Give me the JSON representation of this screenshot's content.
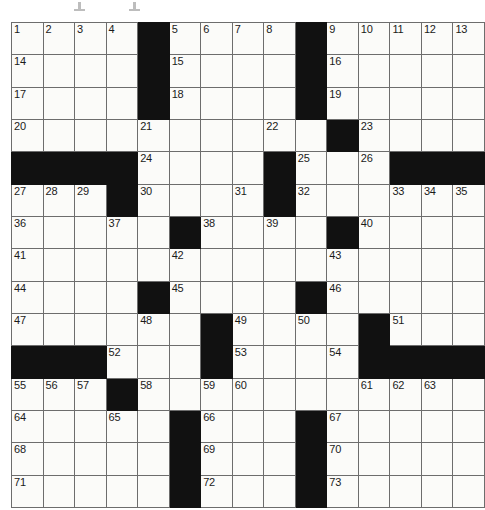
{
  "puzzle": {
    "title": "Crossword Puzzle Grid",
    "rows": 15,
    "cols": 15,
    "cell_size": 31,
    "colors": {
      "block": "#111111",
      "cell": "#fbfbf9",
      "grid_line": "#6d6d6d",
      "number_text": "#1a1a1a",
      "page_background": "#ffffff"
    },
    "numbers_total": 73,
    "across_numbers": [
      1,
      5,
      9,
      14,
      15,
      16,
      17,
      18,
      19,
      20,
      22,
      23,
      24,
      25,
      27,
      30,
      32,
      33,
      36,
      37,
      38,
      40,
      41,
      42,
      43,
      44,
      45,
      46,
      47,
      49,
      51,
      52,
      53,
      55,
      58,
      59,
      61,
      64,
      65,
      66,
      67,
      68,
      69,
      70,
      71,
      72,
      73
    ],
    "down_numbers": [
      1,
      2,
      3,
      4,
      5,
      6,
      7,
      8,
      9,
      10,
      11,
      12,
      13,
      21,
      26,
      28,
      29,
      31,
      34,
      35,
      39,
      48,
      50,
      54,
      56,
      57,
      60,
      62,
      63
    ],
    "grid": [
      [
        {
          "block": false,
          "number": "1"
        },
        {
          "block": false,
          "number": "2"
        },
        {
          "block": false,
          "number": "3"
        },
        {
          "block": false,
          "number": "4"
        },
        {
          "block": true,
          "number": ""
        },
        {
          "block": false,
          "number": "5"
        },
        {
          "block": false,
          "number": "6"
        },
        {
          "block": false,
          "number": "7"
        },
        {
          "block": false,
          "number": "8"
        },
        {
          "block": true,
          "number": ""
        },
        {
          "block": false,
          "number": "9"
        },
        {
          "block": false,
          "number": "10"
        },
        {
          "block": false,
          "number": "11"
        },
        {
          "block": false,
          "number": "12"
        },
        {
          "block": false,
          "number": "13"
        }
      ],
      [
        {
          "block": false,
          "number": "14"
        },
        {
          "block": false,
          "number": ""
        },
        {
          "block": false,
          "number": ""
        },
        {
          "block": false,
          "number": ""
        },
        {
          "block": true,
          "number": ""
        },
        {
          "block": false,
          "number": "15"
        },
        {
          "block": false,
          "number": ""
        },
        {
          "block": false,
          "number": ""
        },
        {
          "block": false,
          "number": ""
        },
        {
          "block": true,
          "number": ""
        },
        {
          "block": false,
          "number": "16"
        },
        {
          "block": false,
          "number": ""
        },
        {
          "block": false,
          "number": ""
        },
        {
          "block": false,
          "number": ""
        },
        {
          "block": false,
          "number": ""
        }
      ],
      [
        {
          "block": false,
          "number": "17"
        },
        {
          "block": false,
          "number": ""
        },
        {
          "block": false,
          "number": ""
        },
        {
          "block": false,
          "number": ""
        },
        {
          "block": true,
          "number": ""
        },
        {
          "block": false,
          "number": "18"
        },
        {
          "block": false,
          "number": ""
        },
        {
          "block": false,
          "number": ""
        },
        {
          "block": false,
          "number": ""
        },
        {
          "block": true,
          "number": ""
        },
        {
          "block": false,
          "number": "19"
        },
        {
          "block": false,
          "number": ""
        },
        {
          "block": false,
          "number": ""
        },
        {
          "block": false,
          "number": ""
        },
        {
          "block": false,
          "number": ""
        }
      ],
      [
        {
          "block": false,
          "number": "20"
        },
        {
          "block": false,
          "number": ""
        },
        {
          "block": false,
          "number": ""
        },
        {
          "block": false,
          "number": ""
        },
        {
          "block": false,
          "number": "21"
        },
        {
          "block": false,
          "number": ""
        },
        {
          "block": false,
          "number": ""
        },
        {
          "block": false,
          "number": ""
        },
        {
          "block": false,
          "number": "22"
        },
        {
          "block": false,
          "number": ""
        },
        {
          "block": true,
          "number": ""
        },
        {
          "block": false,
          "number": "23"
        },
        {
          "block": false,
          "number": ""
        },
        {
          "block": false,
          "number": ""
        },
        {
          "block": false,
          "number": ""
        }
      ],
      [
        {
          "block": true,
          "number": ""
        },
        {
          "block": true,
          "number": ""
        },
        {
          "block": true,
          "number": ""
        },
        {
          "block": true,
          "number": ""
        },
        {
          "block": false,
          "number": "24"
        },
        {
          "block": false,
          "number": ""
        },
        {
          "block": false,
          "number": ""
        },
        {
          "block": false,
          "number": ""
        },
        {
          "block": true,
          "number": ""
        },
        {
          "block": false,
          "number": "25"
        },
        {
          "block": false,
          "number": ""
        },
        {
          "block": false,
          "number": "26"
        },
        {
          "block": true,
          "number": ""
        },
        {
          "block": true,
          "number": ""
        },
        {
          "block": true,
          "number": ""
        }
      ],
      [
        {
          "block": false,
          "number": "27"
        },
        {
          "block": false,
          "number": "28"
        },
        {
          "block": false,
          "number": "29"
        },
        {
          "block": true,
          "number": ""
        },
        {
          "block": false,
          "number": "30"
        },
        {
          "block": false,
          "number": ""
        },
        {
          "block": false,
          "number": ""
        },
        {
          "block": false,
          "number": "31"
        },
        {
          "block": true,
          "number": ""
        },
        {
          "block": false,
          "number": "32"
        },
        {
          "block": false,
          "number": ""
        },
        {
          "block": false,
          "number": ""
        },
        {
          "block": false,
          "number": "33"
        },
        {
          "block": false,
          "number": "34"
        },
        {
          "block": false,
          "number": "35"
        }
      ],
      [
        {
          "block": false,
          "number": "36"
        },
        {
          "block": false,
          "number": ""
        },
        {
          "block": false,
          "number": ""
        },
        {
          "block": false,
          "number": "37"
        },
        {
          "block": false,
          "number": ""
        },
        {
          "block": true,
          "number": ""
        },
        {
          "block": false,
          "number": "38"
        },
        {
          "block": false,
          "number": ""
        },
        {
          "block": false,
          "number": "39"
        },
        {
          "block": false,
          "number": ""
        },
        {
          "block": true,
          "number": ""
        },
        {
          "block": false,
          "number": "40"
        },
        {
          "block": false,
          "number": ""
        },
        {
          "block": false,
          "number": ""
        },
        {
          "block": false,
          "number": ""
        }
      ],
      [
        {
          "block": false,
          "number": "41"
        },
        {
          "block": false,
          "number": ""
        },
        {
          "block": false,
          "number": ""
        },
        {
          "block": false,
          "number": ""
        },
        {
          "block": false,
          "number": ""
        },
        {
          "block": false,
          "number": "42"
        },
        {
          "block": false,
          "number": ""
        },
        {
          "block": false,
          "number": ""
        },
        {
          "block": false,
          "number": ""
        },
        {
          "block": false,
          "number": ""
        },
        {
          "block": false,
          "number": "43"
        },
        {
          "block": false,
          "number": ""
        },
        {
          "block": false,
          "number": ""
        },
        {
          "block": false,
          "number": ""
        },
        {
          "block": false,
          "number": ""
        }
      ],
      [
        {
          "block": false,
          "number": "44"
        },
        {
          "block": false,
          "number": ""
        },
        {
          "block": false,
          "number": ""
        },
        {
          "block": false,
          "number": ""
        },
        {
          "block": true,
          "number": ""
        },
        {
          "block": false,
          "number": "45"
        },
        {
          "block": false,
          "number": ""
        },
        {
          "block": false,
          "number": ""
        },
        {
          "block": false,
          "number": ""
        },
        {
          "block": true,
          "number": ""
        },
        {
          "block": false,
          "number": "46"
        },
        {
          "block": false,
          "number": ""
        },
        {
          "block": false,
          "number": ""
        },
        {
          "block": false,
          "number": ""
        },
        {
          "block": false,
          "number": ""
        }
      ],
      [
        {
          "block": false,
          "number": "47"
        },
        {
          "block": false,
          "number": ""
        },
        {
          "block": false,
          "number": ""
        },
        {
          "block": false,
          "number": ""
        },
        {
          "block": false,
          "number": "48"
        },
        {
          "block": false,
          "number": ""
        },
        {
          "block": true,
          "number": ""
        },
        {
          "block": false,
          "number": "49"
        },
        {
          "block": false,
          "number": ""
        },
        {
          "block": false,
          "number": "50"
        },
        {
          "block": false,
          "number": ""
        },
        {
          "block": true,
          "number": ""
        },
        {
          "block": false,
          "number": "51"
        },
        {
          "block": false,
          "number": ""
        },
        {
          "block": false,
          "number": ""
        }
      ],
      [
        {
          "block": true,
          "number": ""
        },
        {
          "block": true,
          "number": ""
        },
        {
          "block": true,
          "number": ""
        },
        {
          "block": false,
          "number": "52"
        },
        {
          "block": false,
          "number": ""
        },
        {
          "block": false,
          "number": ""
        },
        {
          "block": true,
          "number": ""
        },
        {
          "block": false,
          "number": "53"
        },
        {
          "block": false,
          "number": ""
        },
        {
          "block": false,
          "number": ""
        },
        {
          "block": false,
          "number": "54"
        },
        {
          "block": true,
          "number": ""
        },
        {
          "block": true,
          "number": ""
        },
        {
          "block": true,
          "number": ""
        },
        {
          "block": true,
          "number": ""
        }
      ],
      [
        {
          "block": false,
          "number": "55"
        },
        {
          "block": false,
          "number": "56"
        },
        {
          "block": false,
          "number": "57"
        },
        {
          "block": true,
          "number": ""
        },
        {
          "block": false,
          "number": "58"
        },
        {
          "block": false,
          "number": ""
        },
        {
          "block": false,
          "number": "59"
        },
        {
          "block": false,
          "number": "60"
        },
        {
          "block": false,
          "number": ""
        },
        {
          "block": false,
          "number": ""
        },
        {
          "block": false,
          "number": ""
        },
        {
          "block": false,
          "number": "61"
        },
        {
          "block": false,
          "number": "62"
        },
        {
          "block": false,
          "number": "63"
        },
        {
          "block": false,
          "number": ""
        }
      ],
      [
        {
          "block": false,
          "number": "64"
        },
        {
          "block": false,
          "number": ""
        },
        {
          "block": false,
          "number": ""
        },
        {
          "block": false,
          "number": "65"
        },
        {
          "block": false,
          "number": ""
        },
        {
          "block": true,
          "number": ""
        },
        {
          "block": false,
          "number": "66"
        },
        {
          "block": false,
          "number": ""
        },
        {
          "block": false,
          "number": ""
        },
        {
          "block": true,
          "number": ""
        },
        {
          "block": false,
          "number": "67"
        },
        {
          "block": false,
          "number": ""
        },
        {
          "block": false,
          "number": ""
        },
        {
          "block": false,
          "number": ""
        },
        {
          "block": false,
          "number": ""
        }
      ],
      [
        {
          "block": false,
          "number": "68"
        },
        {
          "block": false,
          "number": ""
        },
        {
          "block": false,
          "number": ""
        },
        {
          "block": false,
          "number": ""
        },
        {
          "block": false,
          "number": ""
        },
        {
          "block": true,
          "number": ""
        },
        {
          "block": false,
          "number": "69"
        },
        {
          "block": false,
          "number": ""
        },
        {
          "block": false,
          "number": ""
        },
        {
          "block": true,
          "number": ""
        },
        {
          "block": false,
          "number": "70"
        },
        {
          "block": false,
          "number": ""
        },
        {
          "block": false,
          "number": ""
        },
        {
          "block": false,
          "number": ""
        },
        {
          "block": false,
          "number": ""
        }
      ],
      [
        {
          "block": false,
          "number": "71"
        },
        {
          "block": false,
          "number": ""
        },
        {
          "block": false,
          "number": ""
        },
        {
          "block": false,
          "number": ""
        },
        {
          "block": false,
          "number": ""
        },
        {
          "block": true,
          "number": ""
        },
        {
          "block": false,
          "number": "72"
        },
        {
          "block": false,
          "number": ""
        },
        {
          "block": false,
          "number": ""
        },
        {
          "block": true,
          "number": ""
        },
        {
          "block": false,
          "number": "73"
        },
        {
          "block": false,
          "number": ""
        },
        {
          "block": false,
          "number": ""
        },
        {
          "block": false,
          "number": ""
        },
        {
          "block": false,
          "number": ""
        }
      ]
    ]
  }
}
